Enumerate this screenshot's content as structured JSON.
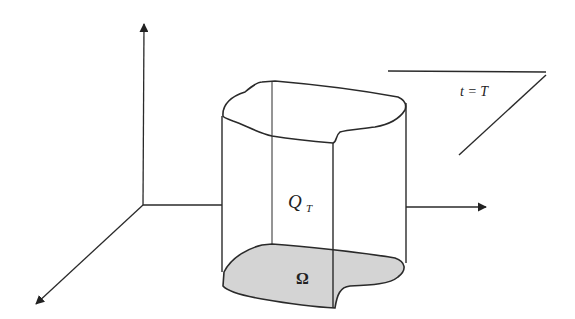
{
  "diagram": {
    "type": "space-time cylinder",
    "labels": {
      "plane": "t = T",
      "cylinder": "Q",
      "cylinder_subscript": "T",
      "base": "Ω"
    },
    "colors": {
      "stroke": "#2a2a2a",
      "base_fill": "#d4d4d4",
      "background": "#ffffff"
    },
    "axes": [
      "vertical-axis",
      "horizontal-axis",
      "diagonal-axis"
    ]
  }
}
